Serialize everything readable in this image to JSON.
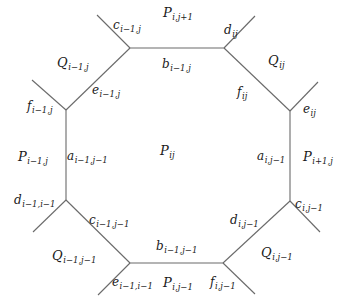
{
  "diagram": {
    "stroke_color": "#6a6a6a",
    "vertices": {
      "top_left": [
        130,
        48
      ],
      "top_right": [
        224,
        48
      ],
      "right_upper": [
        290,
        111
      ],
      "right_lower": [
        290,
        201
      ],
      "bottom_right": [
        223,
        263
      ],
      "bottom_left": [
        130,
        263
      ],
      "left_lower": [
        66,
        200
      ],
      "left_upper": [
        66,
        110
      ]
    },
    "edges": [
      {
        "name": "edge-top",
        "from": [
          130,
          48
        ],
        "to": [
          224,
          48
        ]
      },
      {
        "name": "edge-top-right-diag",
        "from": [
          224,
          48
        ],
        "to": [
          290,
          111
        ]
      },
      {
        "name": "edge-right",
        "from": [
          290,
          111
        ],
        "to": [
          290,
          201
        ]
      },
      {
        "name": "edge-bottom-right-diag",
        "from": [
          290,
          201
        ],
        "to": [
          223,
          263
        ]
      },
      {
        "name": "edge-bottom",
        "from": [
          223,
          263
        ],
        "to": [
          130,
          263
        ]
      },
      {
        "name": "edge-bottom-left-diag",
        "from": [
          130,
          263
        ],
        "to": [
          66,
          200
        ]
      },
      {
        "name": "edge-left",
        "from": [
          66,
          200
        ],
        "to": [
          66,
          110
        ]
      },
      {
        "name": "edge-top-left-diag",
        "from": [
          66,
          110
        ],
        "to": [
          130,
          48
        ]
      },
      {
        "name": "spoke-top-left",
        "from": [
          130,
          48
        ],
        "to": [
          97,
          15
        ]
      },
      {
        "name": "spoke-top-right",
        "from": [
          224,
          48
        ],
        "to": [
          255,
          16
        ]
      },
      {
        "name": "spoke-right-upper",
        "from": [
          290,
          111
        ],
        "to": [
          318,
          82
        ]
      },
      {
        "name": "spoke-right-lower",
        "from": [
          290,
          201
        ],
        "to": [
          320,
          232
        ]
      },
      {
        "name": "spoke-bottom-right",
        "from": [
          223,
          263
        ],
        "to": [
          255,
          294
        ]
      },
      {
        "name": "spoke-bottom-left",
        "from": [
          130,
          263
        ],
        "to": [
          98,
          295
        ]
      },
      {
        "name": "spoke-left-lower",
        "from": [
          66,
          200
        ],
        "to": [
          33,
          232
        ]
      },
      {
        "name": "spoke-left-upper",
        "from": [
          66,
          110
        ],
        "to": [
          32,
          80
        ]
      }
    ],
    "labels": [
      {
        "name": "face-P-ij",
        "base": "P",
        "sub": "ij",
        "x": 160,
        "y": 144,
        "big": true
      },
      {
        "name": "face-P-i-jp1",
        "base": "P",
        "sub": "i,j+1",
        "x": 163,
        "y": 6,
        "big": true
      },
      {
        "name": "face-P-i-jm1",
        "base": "P",
        "sub": "i,j−1",
        "x": 163,
        "y": 276,
        "big": true
      },
      {
        "name": "face-P-im1-j",
        "base": "P",
        "sub": "i−1,j",
        "x": 18,
        "y": 150,
        "big": true
      },
      {
        "name": "face-P-ip1-j",
        "base": "P",
        "sub": "i+1,j",
        "x": 303,
        "y": 150,
        "big": true
      },
      {
        "name": "face-Q-im1-j",
        "base": "Q",
        "sub": "i−1,j",
        "x": 57,
        "y": 56,
        "big": true
      },
      {
        "name": "face-Q-ij",
        "base": "Q",
        "sub": "ij",
        "x": 268,
        "y": 54,
        "big": true
      },
      {
        "name": "face-Q-im1-jm1",
        "base": "Q",
        "sub": "i−1,j−1",
        "x": 52,
        "y": 249,
        "big": true
      },
      {
        "name": "face-Q-i-jm1",
        "base": "Q",
        "sub": "i,j−1",
        "x": 261,
        "y": 246,
        "big": true
      },
      {
        "name": "edge-label-c-im1-j",
        "base": "c",
        "sub": "i−1,j",
        "x": 113,
        "y": 19
      },
      {
        "name": "edge-label-d-ij",
        "base": "d",
        "sub": "ij",
        "x": 224,
        "y": 24
      },
      {
        "name": "edge-label-b-im1-j",
        "base": "b",
        "sub": "i−1,j",
        "x": 162,
        "y": 58
      },
      {
        "name": "edge-label-e-im1-j",
        "base": "e",
        "sub": "i−1,j",
        "x": 92,
        "y": 84
      },
      {
        "name": "edge-label-f-ij",
        "base": "f",
        "sub": "ij",
        "x": 237,
        "y": 86
      },
      {
        "name": "edge-label-f-im1-j",
        "base": "f",
        "sub": "i−1,j",
        "x": 27,
        "y": 100
      },
      {
        "name": "edge-label-e-ij",
        "base": "e",
        "sub": "ij",
        "x": 303,
        "y": 103
      },
      {
        "name": "edge-label-a-im1-jm1",
        "base": "a",
        "sub": "i−1,j−1",
        "x": 67,
        "y": 150
      },
      {
        "name": "edge-label-a-i-jm1",
        "base": "a",
        "sub": "i,j−1",
        "x": 257,
        "y": 150
      },
      {
        "name": "edge-label-d-im1-im1",
        "base": "d",
        "sub": "i−1,i−1",
        "x": 14,
        "y": 194
      },
      {
        "name": "edge-label-c-i-jm1",
        "base": "c",
        "sub": "i,j−1",
        "x": 295,
        "y": 198
      },
      {
        "name": "edge-label-c-im1-jm1",
        "base": "c",
        "sub": "i−1,j−1",
        "x": 89,
        "y": 214
      },
      {
        "name": "edge-label-d-i-jm1",
        "base": "d",
        "sub": "i,j−1",
        "x": 230,
        "y": 214
      },
      {
        "name": "edge-label-b-im1-jm1",
        "base": "b",
        "sub": "i−1,j−1",
        "x": 156,
        "y": 240
      },
      {
        "name": "edge-label-e-im1-im1",
        "base": "e",
        "sub": "i−1,i−1",
        "x": 112,
        "y": 276
      },
      {
        "name": "edge-label-f-i-jm1",
        "base": "f",
        "sub": "i,j−1",
        "x": 210,
        "y": 276
      }
    ]
  }
}
